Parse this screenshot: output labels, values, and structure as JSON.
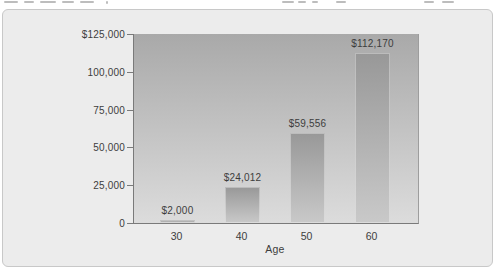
{
  "chart_data": {
    "type": "bar",
    "categories": [
      "30",
      "40",
      "50",
      "60"
    ],
    "values": [
      2000,
      24012,
      59556,
      112170
    ],
    "bar_labels": [
      "$2,000",
      "$24,012",
      "$59,556",
      "$112,170"
    ],
    "title": "",
    "xlabel": "Age",
    "ylabel": "",
    "ylim": [
      0,
      125000
    ],
    "grid": false,
    "legend": null,
    "yticks": [
      {
        "value": 125000,
        "label": "$125,000"
      },
      {
        "value": 100000,
        "label": "100,000"
      },
      {
        "value": 75000,
        "label": "75,000"
      },
      {
        "value": 50000,
        "label": "50,000"
      },
      {
        "value": 25000,
        "label": "25,000"
      },
      {
        "value": 0,
        "label": "0"
      }
    ]
  },
  "colors": {
    "panel_bg": "#ececec",
    "panel_border": "#c8c8c8",
    "plot_top": "#a9a9a9",
    "plot_bottom": "#dcdcdc",
    "bar_top": "#989898",
    "bar_bottom": "#c9c9c9",
    "axis": "#7a7a7a",
    "text": "#3d3d3d"
  }
}
